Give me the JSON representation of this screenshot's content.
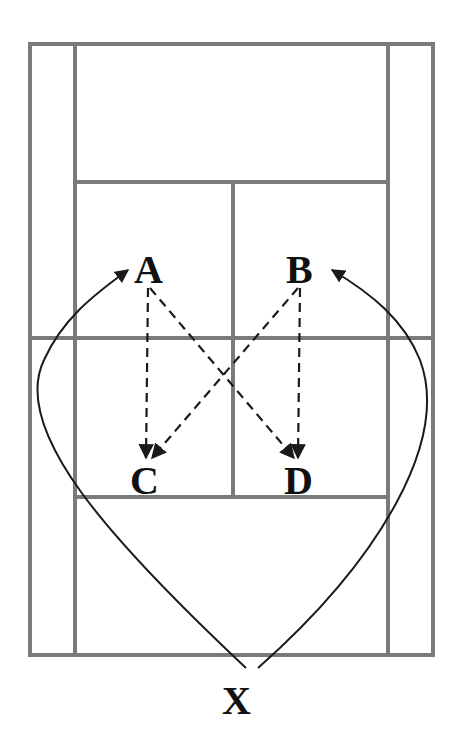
{
  "diagram": {
    "type": "tennis-court-drill",
    "colors": {
      "court_lines": "#7a7a7a",
      "paths": "#1a1a1a",
      "labels": "#111111",
      "background": "#ffffff"
    },
    "positions": [
      {
        "id": "A",
        "label": "A"
      },
      {
        "id": "B",
        "label": "B"
      },
      {
        "id": "C",
        "label": "C"
      },
      {
        "id": "D",
        "label": "D"
      },
      {
        "id": "X",
        "label": "X"
      }
    ],
    "movements": [
      {
        "from": "X",
        "to": "A",
        "style": "solid-curved"
      },
      {
        "from": "X",
        "to": "B",
        "style": "solid-curved"
      },
      {
        "from": "A",
        "to": "C",
        "style": "dashed"
      },
      {
        "from": "A",
        "to": "D",
        "style": "dashed"
      },
      {
        "from": "B",
        "to": "C",
        "style": "dashed"
      },
      {
        "from": "B",
        "to": "D",
        "style": "dashed"
      }
    ]
  }
}
